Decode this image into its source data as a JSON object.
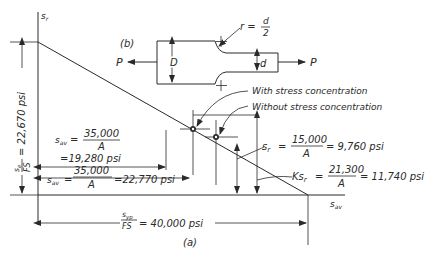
{
  "figure": {
    "subfigure_a_label": "(a)",
    "subfigure_b_label": "(b)"
  },
  "axes": {
    "y_label": "s",
    "y_label_sub": "r",
    "x_label": "s",
    "x_label_sub": "av"
  },
  "left_dimension": {
    "fraction_num": "s",
    "fraction_num_sub": "e",
    "fraction_den": "FS",
    "value": "= 22,670 psi"
  },
  "bottom_dimension": {
    "fraction_num": "s",
    "fraction_num_sub": "yp",
    "fraction_den": "FS",
    "value": "= 40,000 psi"
  },
  "dim_with_sc": {
    "lhs": "s",
    "lhs_sub": "av",
    "eq": "=",
    "num": "35,000",
    "den": "A",
    "value": "=19,280 psi"
  },
  "dim_without_sc": {
    "lhs": "s",
    "lhs_sub": "av",
    "eq": "=",
    "num": "35,000",
    "den": "A",
    "value": "=22,770 psi"
  },
  "sr_annotation": {
    "lhs": "s",
    "lhs_sub": "r",
    "eq": "=",
    "num": "15,000",
    "den": "A",
    "value": "= 9,760 psi"
  },
  "ksr_annotation": {
    "lhs": "Ks",
    "lhs_sub": "r",
    "eq": "=",
    "num": "21,300",
    "den": "A",
    "value": "= 11,740 psi"
  },
  "point_labels": {
    "with_sc": "With stress concentration",
    "without_sc": "Without stress concentration"
  },
  "specimen": {
    "load_left": "P",
    "load_right": "P",
    "large_dim": "D",
    "small_dim": "d",
    "fillet_label_lhs": "r =",
    "fillet_num": "d",
    "fillet_den": "2"
  }
}
